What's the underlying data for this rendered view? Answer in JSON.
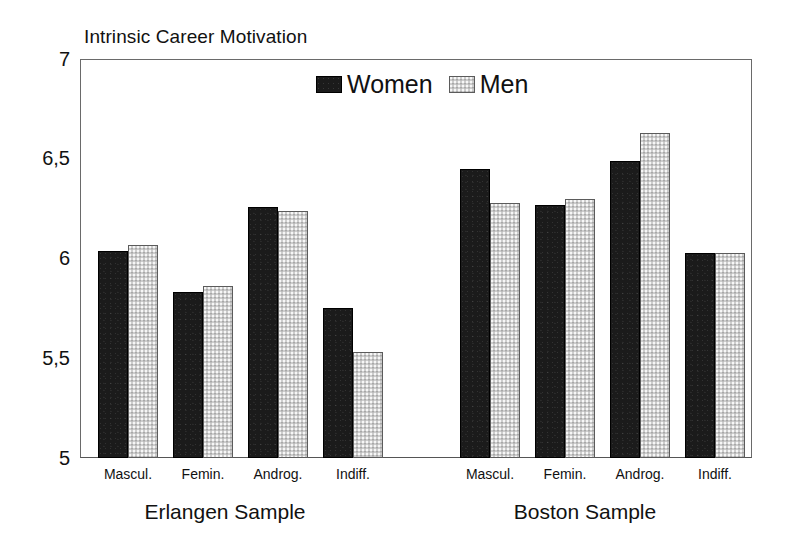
{
  "chart_data": {
    "type": "bar",
    "title": "Intrinsic Career Motivation",
    "xlabel": "",
    "ylabel": "",
    "ylim": [
      5,
      7
    ],
    "yticks": [
      "5",
      "5,5",
      "6",
      "6,5",
      "7"
    ],
    "ytick_values": [
      5,
      5.5,
      6,
      6.5,
      7
    ],
    "grid": false,
    "legend_position": "top-center",
    "groups": [
      "Erlangen Sample",
      "Boston Sample"
    ],
    "categories": [
      "Mascul.",
      "Femin.",
      "Androg.",
      "Indiff."
    ],
    "series": [
      {
        "name": "Women",
        "color": "#1b1b1b",
        "values_erlangen": [
          6.04,
          5.83,
          6.26,
          5.75
        ],
        "values_boston": [
          6.45,
          6.27,
          6.49,
          6.03
        ]
      },
      {
        "name": "Men",
        "color": "#cdcdcd",
        "values_erlangen": [
          6.07,
          5.86,
          6.24,
          5.53
        ],
        "values_boston": [
          6.28,
          6.3,
          6.63,
          6.03
        ]
      }
    ]
  },
  "legend": {
    "items": [
      {
        "label": "Women",
        "swatch": "dark-swatch-icon"
      },
      {
        "label": "Men",
        "swatch": "light-swatch-icon"
      }
    ]
  },
  "axes": {
    "y_labels": [
      "7",
      "6,5",
      "6",
      "5,5",
      "5"
    ]
  },
  "group_labels": [
    "Erlangen Sample",
    "Boston Sample"
  ],
  "category_labels_erlangen": [
    "Mascul.",
    "Femin.",
    "Androg.",
    "Indiff."
  ],
  "category_labels_boston": [
    "Mascul.",
    "Femin.",
    "Androg.",
    "Indiff."
  ]
}
